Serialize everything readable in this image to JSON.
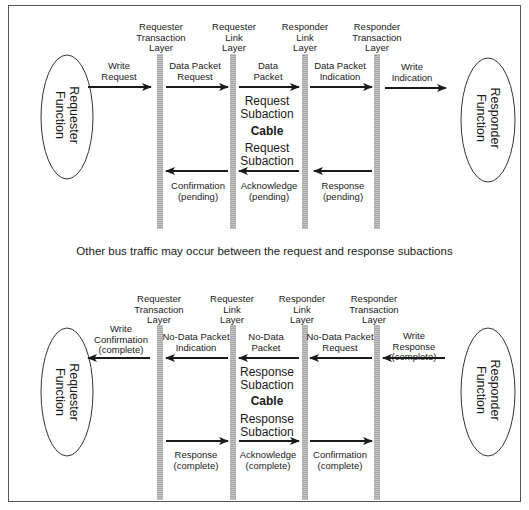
{
  "diagram": {
    "top": {
      "layers": [
        {
          "label": "Requester\nTransaction\nLayer"
        },
        {
          "label": "Requester\nLink\nLayer"
        },
        {
          "label": "Responder\nLink\nLayer"
        },
        {
          "label": "Responder\nTransaction\nLayer"
        }
      ],
      "left_function": "Requester\nFunction",
      "right_function": "Responder\nFunction",
      "arrows_forward": [
        {
          "label": "Write\nRequest",
          "direction": "right"
        },
        {
          "label": "Data Packet\nRequest",
          "direction": "right"
        },
        {
          "label": "Data\nPacket",
          "direction": "right"
        },
        {
          "label": "Data Packet\nIndication",
          "direction": "right"
        },
        {
          "label": "Write\nIndication",
          "direction": "right"
        }
      ],
      "arrows_back": [
        {
          "label": "Confirmation\n(pending)",
          "direction": "left"
        },
        {
          "label": "Acknowledge\n(pending)",
          "direction": "left"
        },
        {
          "label": "Response\n(pending)",
          "direction": "left"
        }
      ],
      "subaction_upper": "Request\nSubaction",
      "cable": "Cable",
      "subaction_lower": "Request\nSubaction"
    },
    "note": "Other bus traffic may occur between the request and response subactions",
    "bottom": {
      "layers": [
        {
          "label": "Requester\nTransaction\nLayer"
        },
        {
          "label": "Requester\nLink\nLayer"
        },
        {
          "label": "Responder\nLink\nLayer"
        },
        {
          "label": "Responder\nTransaction\nLayer"
        }
      ],
      "left_function": "Requester\nFunction",
      "right_function": "Responder\nFunction",
      "arrows_upper": [
        {
          "label": "Write\nConfirmation\n(complete)",
          "direction": "left"
        },
        {
          "label": "No-Data Packet\nIndication",
          "direction": "left"
        },
        {
          "label": "No-Data\nPacket",
          "direction": "left"
        },
        {
          "label": "No-Data Packet\nRequest",
          "direction": "left"
        },
        {
          "label": "Write\nResponse\n(complete)",
          "direction": "left"
        }
      ],
      "arrows_lower": [
        {
          "label": "Response\n(complete)",
          "direction": "right"
        },
        {
          "label": "Acknowledge\n(complete)",
          "direction": "right"
        },
        {
          "label": "Confirmation\n(complete)",
          "direction": "right"
        }
      ],
      "subaction_upper": "Response\nSubaction",
      "cable": "Cable",
      "subaction_lower": "Response\nSubaction"
    },
    "colors": {
      "line": "#1a1a1a",
      "layer_bar": "#b9b9b9",
      "frame": "#555555"
    }
  }
}
